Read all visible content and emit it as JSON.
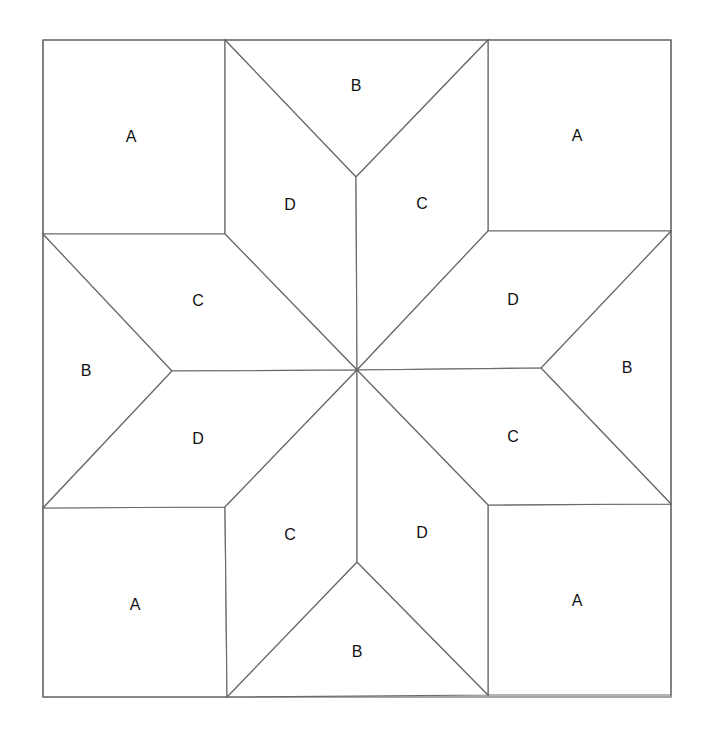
{
  "diagram": {
    "type": "quilt-block",
    "pattern": "eight-pointed star",
    "line_color": "#6b6b6b",
    "label_color": "#111111",
    "pieces": [
      {
        "id": "corner-top-left",
        "label": "A",
        "shape": "square",
        "points": "43,40 225,40 225,234 43,234",
        "label_pos": [
          131,
          136
        ]
      },
      {
        "id": "corner-top-right",
        "label": "A",
        "shape": "square",
        "points": "488,40 671,40 671,231 488,231",
        "label_pos": [
          577,
          135
        ]
      },
      {
        "id": "corner-bottom-left",
        "label": "A",
        "shape": "square",
        "points": "43,508 225,507 227,697 43,697",
        "label_pos": [
          135,
          604
        ]
      },
      {
        "id": "corner-bottom-right",
        "label": "A",
        "shape": "square",
        "points": "488,505 671,504 671,695 488,695",
        "label_pos": [
          577,
          600
        ]
      },
      {
        "id": "triangle-top",
        "label": "B",
        "shape": "triangle",
        "points": "225,40 488,40 356,177",
        "label_pos": [
          356,
          85
        ]
      },
      {
        "id": "triangle-left",
        "label": "B",
        "shape": "triangle",
        "points": "43,234 43,508 172,371",
        "label_pos": [
          86,
          370
        ]
      },
      {
        "id": "triangle-right",
        "label": "B",
        "shape": "triangle",
        "points": "671,231 671,504 541,368",
        "label_pos": [
          627,
          367
        ]
      },
      {
        "id": "triangle-bottom",
        "label": "B",
        "shape": "triangle",
        "points": "227,697 488,695 357,562",
        "label_pos": [
          357,
          651
        ]
      },
      {
        "id": "diamond-top-left",
        "label": "D",
        "shape": "diamond",
        "points": "225,40 356,177 357,370 225,234",
        "label_pos": [
          290,
          204
        ]
      },
      {
        "id": "diamond-top-right",
        "label": "C",
        "shape": "diamond",
        "points": "488,40 356,177 357,370 488,231",
        "label_pos": [
          422,
          203
        ]
      },
      {
        "id": "diamond-left-top",
        "label": "C",
        "shape": "diamond",
        "points": "43,234 225,234 357,370 172,371",
        "label_pos": [
          198,
          300
        ]
      },
      {
        "id": "diamond-left-bottom",
        "label": "D",
        "shape": "diamond",
        "points": "43,508 225,507 357,370 172,371",
        "label_pos": [
          198,
          438
        ]
      },
      {
        "id": "diamond-right-top",
        "label": "D",
        "shape": "diamond",
        "points": "671,231 488,231 357,370 541,368",
        "label_pos": [
          513,
          299
        ]
      },
      {
        "id": "diamond-right-bottom",
        "label": "C",
        "shape": "diamond",
        "points": "671,504 488,505 357,370 541,368",
        "label_pos": [
          513,
          436
        ]
      },
      {
        "id": "diamond-bottom-left",
        "label": "C",
        "shape": "diamond",
        "points": "227,697 225,507 357,370 357,562",
        "label_pos": [
          290,
          534
        ]
      },
      {
        "id": "diamond-bottom-right",
        "label": "D",
        "shape": "diamond",
        "points": "488,695 488,505 357,370 357,562",
        "label_pos": [
          422,
          532
        ]
      }
    ]
  }
}
